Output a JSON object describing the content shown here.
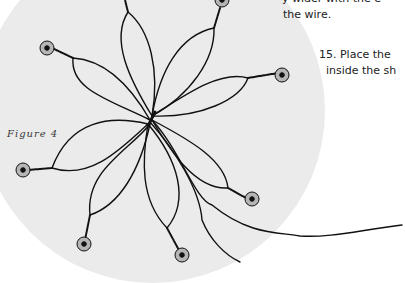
{
  "figure": {
    "caption": "Figure 4",
    "background_color": "#ebebeb",
    "bead_fill": "#b5b5b5",
    "wire_color": "#111111"
  },
  "instructions": {
    "lines": [
      "y  wider  with  the  e",
      "the wire.",
      "15. Place the ",
      "inside the sh"
    ]
  }
}
